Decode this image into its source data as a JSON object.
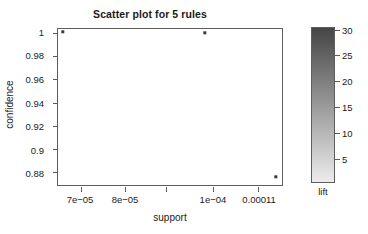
{
  "chart_data": {
    "type": "scatter",
    "title": "Scatter plot for 5 rules",
    "xlabel": "support",
    "ylabel": "confidence",
    "xlim": [
      6.55e-05,
      0.0001175
    ],
    "ylim": [
      0.8695,
      1.004
    ],
    "grid": false,
    "x_ticks": [
      {
        "value": 7e-05,
        "label": "7e−05",
        "pos_pct": 10.2
      },
      {
        "value": 8e-05,
        "label": "8e−05",
        "pos_pct": 30.1
      },
      {
        "value": 9e-05,
        "label": "",
        "pos_pct": 48.2
      },
      {
        "value": 0.0001,
        "label": "1e−04",
        "pos_pct": 69.0
      },
      {
        "value": 0.00011,
        "label": "0.00011",
        "pos_pct": 89.4
      }
    ],
    "y_ticks": [
      {
        "value": 1.0,
        "label": "1",
        "pos_pct": 2.5
      },
      {
        "value": 0.98,
        "label": "0.98",
        "pos_pct": 17.4
      },
      {
        "value": 0.96,
        "label": "0.96",
        "pos_pct": 32.3
      },
      {
        "value": 0.94,
        "label": "0.94",
        "pos_pct": 47.2
      },
      {
        "value": 0.92,
        "label": "0.92",
        "pos_pct": 62.1
      },
      {
        "value": 0.9,
        "label": "0.9",
        "pos_pct": 77.0
      },
      {
        "value": 0.88,
        "label": "0.88",
        "pos_pct": 91.9
      }
    ],
    "points": [
      {
        "support": 6.8e-05,
        "confidence": 1.0,
        "x_pct": 2.2,
        "y_pct": 1.9
      },
      {
        "support": 9.75e-05,
        "confidence": 1.0,
        "x_pct": 65.5,
        "y_pct": 2.5
      },
      {
        "support": 0.000114,
        "confidence": 0.874,
        "x_pct": 97.3,
        "y_pct": 94.9
      }
    ],
    "n_rules": 5,
    "colorbar": {
      "title": "lift",
      "ticks": [
        {
          "value": 30,
          "label": "30",
          "pos_pct": 1.9
        },
        {
          "value": 25,
          "label": "25",
          "pos_pct": 17.9
        },
        {
          "value": 20,
          "label": "20",
          "pos_pct": 34.6
        },
        {
          "value": 15,
          "label": "15",
          "pos_pct": 51.3
        },
        {
          "value": 10,
          "label": "10",
          "pos_pct": 67.9
        },
        {
          "value": 5,
          "label": "5",
          "pos_pct": 84.6
        }
      ],
      "color_top": "#454545",
      "color_bottom": "#ececec"
    },
    "point_color": "#3a3a3a",
    "axis_color": "#5d5d5d"
  }
}
